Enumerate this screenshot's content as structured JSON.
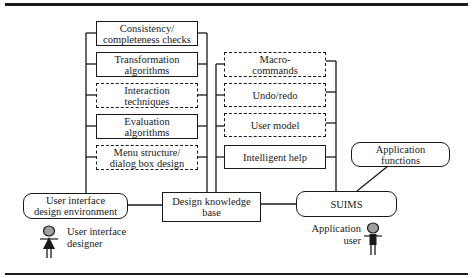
{
  "diagram": {
    "design_tools": [
      {
        "id": "consistency",
        "label": "Consistency/\ncompleteness checks",
        "style": "solid"
      },
      {
        "id": "transformation",
        "label": "Transformation\nalgorithms",
        "style": "solid"
      },
      {
        "id": "interaction",
        "label": "Interaction\ntechniques",
        "style": "dashed"
      },
      {
        "id": "evaluation",
        "label": "Evaluation\nalgorithms",
        "style": "solid"
      },
      {
        "id": "menu",
        "label": "Menu structure/\ndialog box design",
        "style": "dashed"
      }
    ],
    "runtime_components": [
      {
        "id": "macro",
        "label": "Macro-\ncommands",
        "style": "dashed"
      },
      {
        "id": "undo",
        "label": "Undo/redo",
        "style": "dashed"
      },
      {
        "id": "usermodel",
        "label": "User model",
        "style": "dashed"
      },
      {
        "id": "help",
        "label": "Intelligent help",
        "style": "solid"
      }
    ],
    "nodes": {
      "uide": "User interface\ndesign environment",
      "dkb": "Design knowledge\nbase",
      "suims": "SUIMS",
      "appfn": "Application\nfunctions"
    },
    "actors": {
      "designer": {
        "label": "User interface\ndesigner",
        "icon": "person-icon"
      },
      "user": {
        "label": "Application\nuser",
        "icon": "person-icon"
      }
    },
    "colors": {
      "line": "#1a1a1a",
      "head_fill": "#a0a0a0",
      "background": "#ffffff"
    }
  }
}
